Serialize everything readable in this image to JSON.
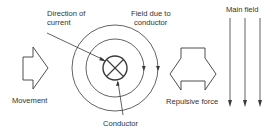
{
  "labels": {
    "direction_of_current_line1": "Direction of",
    "direction_of_current_line2": "current",
    "field_due_to_conductor_line1": "Field due to",
    "field_due_to_conductor_line2": "conductor",
    "main_field": "Main field",
    "movement": "Movement",
    "repulsive_force": "Repulsive force",
    "conductor": "Conductor"
  },
  "icons": {
    "conductor_symbol": "cross-in-circle (current into page)",
    "movement_arrow": "hollow-arrow-right",
    "repulsive_force_arrow": "hollow-double-arrow-left-right",
    "main_field_lines": "arrows-down",
    "field_circle_arrows": "arrow-down"
  },
  "colors": {
    "line": "#3a3a3a",
    "text": "#333333",
    "background": "#ffffff"
  }
}
